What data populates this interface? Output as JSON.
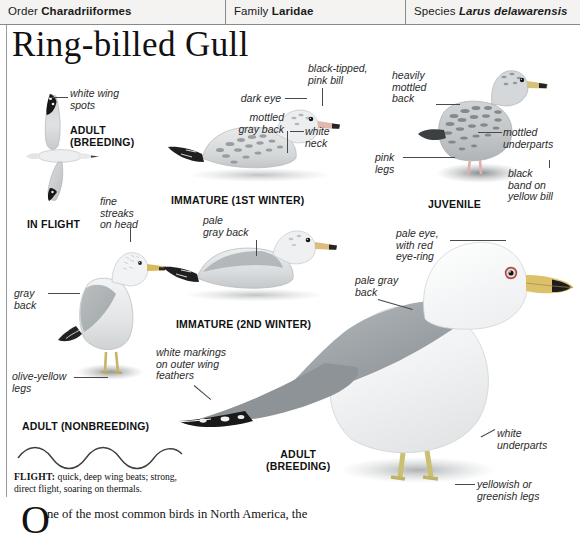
{
  "taxonomy": {
    "order_key": "Order ",
    "order_value": "Charadriiformes",
    "family_key": "Family ",
    "family_value": "Laridae",
    "species_key": "Species ",
    "species_value": "Larus delawarensis"
  },
  "page_title": "Ring-billed Gull",
  "plates": {
    "in_flight": {
      "caption": "IN FLIGHT",
      "stage": "ADULT\n(BREEDING)",
      "labels": [
        {
          "id": "white-wing-spots",
          "text": "white wing\nspots"
        }
      ]
    },
    "adult_nonbreeding": {
      "caption": "ADULT (NONBREEDING)",
      "labels": [
        {
          "id": "fine-streaks-on-head",
          "text": "fine\nstreaks\non head"
        },
        {
          "id": "gray-back",
          "text": "gray\nback"
        },
        {
          "id": "olive-yellow-legs",
          "text": "olive-yellow\nlegs"
        }
      ]
    },
    "immature_1st_winter": {
      "caption": "IMMATURE (1ST WINTER)",
      "labels": [
        {
          "id": "dark-eye",
          "text": "dark eye"
        },
        {
          "id": "mottled-gray-back",
          "text": "mottled\ngray back"
        },
        {
          "id": "black-tipped-pink-bill",
          "text": "black-tipped,\npink bill"
        },
        {
          "id": "white-neck",
          "text": "white\nneck"
        }
      ]
    },
    "immature_2nd_winter": {
      "caption": "IMMATURE (2ND WINTER)",
      "labels": [
        {
          "id": "pale-gray-back",
          "text": "pale\ngray back"
        }
      ]
    },
    "juvenile": {
      "caption": "JUVENILE",
      "labels": [
        {
          "id": "heavily-mottled-back",
          "text": "heavily\nmottled\nback"
        },
        {
          "id": "mottled-underparts",
          "text": "mottled\nunderparts"
        },
        {
          "id": "pink-legs",
          "text": "pink\nlegs"
        },
        {
          "id": "black-band-on-yellow-bill",
          "text": "black\nband on\nyellow bill"
        }
      ]
    },
    "adult_breeding": {
      "caption": "ADULT\n(BREEDING)",
      "labels": [
        {
          "id": "pale-eye-with-red-eye-ring",
          "text": "pale eye,\nwith red\neye-ring"
        },
        {
          "id": "pale-gray-back-large",
          "text": "pale gray\nback"
        },
        {
          "id": "white-markings-on-outer-wing-feathers",
          "text": "white markings\non outer wing\nfeathers"
        },
        {
          "id": "white-underparts",
          "text": "white\nunderparts"
        },
        {
          "id": "yellowish-or-greenish-legs",
          "text": "yellowish or\ngreenish legs"
        }
      ]
    }
  },
  "flight_note": {
    "label": "FLIGHT:",
    "text": " quick, deep wing beats; strong, direct flight, soaring on thermals."
  },
  "body_text": {
    "dropcap": "O",
    "paragraph": "ne of the most common birds in North America, the"
  },
  "colors": {
    "header_bg": "#f4f3f1",
    "rule": "#8a8a8a",
    "text": "#111111",
    "label_text": "#2b2b2b",
    "leader": "#4a4a4a",
    "gull_gray": "#b9bcbe",
    "gull_dark": "#1d1d1d",
    "gull_light": "#ececec"
  }
}
